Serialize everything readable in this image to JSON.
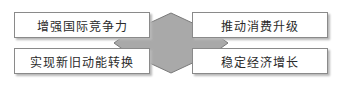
{
  "diagram": {
    "center_shape": {
      "type": "diamond",
      "fill": "#a9a9a9",
      "stroke": "#7a7a7a"
    },
    "boxes": [
      {
        "position": "top-left",
        "label": "增强国际竞争力"
      },
      {
        "position": "bottom-left",
        "label": "实现新旧动能转换"
      },
      {
        "position": "top-right",
        "label": "推动消费升级"
      },
      {
        "position": "bottom-right",
        "label": "稳定经济增长"
      }
    ]
  }
}
